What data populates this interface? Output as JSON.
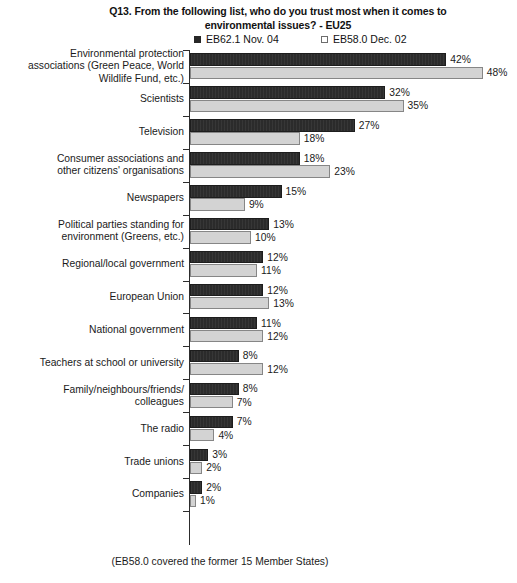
{
  "chart_data": {
    "type": "bar",
    "orientation": "horizontal",
    "title_lines": [
      "Q13. From the following list, who do you trust most when it comes to",
      "environmental issues? - EU25"
    ],
    "xlabel": "",
    "ylabel": "",
    "xlim": [
      0,
      48
    ],
    "grid": false,
    "legend_position": "top",
    "value_suffix": "%",
    "footnote": "(EB58.0 covered the former 15 Member States)",
    "categories": [
      "Environmental protection associations (Green Peace, World Wildlife Fund, etc.)",
      "Scientists",
      "Television",
      "Consumer associations and other citizens' organisations",
      "Newspapers",
      "Political parties standing for environment (Greens, etc.)",
      "Regional/local government",
      "European Union",
      "National government",
      "Teachers at school or university",
      "Family/neighbours/friends/colleagues",
      "The radio",
      "Trade unions",
      "Companies"
    ],
    "category_lines": [
      [
        "Environmental protection",
        "associations (Green Peace, World",
        "Wildlife Fund, etc.)"
      ],
      [
        "Scientists"
      ],
      [
        "Television"
      ],
      [
        "Consumer associations and",
        "other citizens' organisations"
      ],
      [
        "Newspapers"
      ],
      [
        "Political parties standing for",
        "environment (Greens, etc.)"
      ],
      [
        "Regional/local government"
      ],
      [
        "European Union"
      ],
      [
        "National government"
      ],
      [
        "Teachers at school or university"
      ],
      [
        "Family/neighbours/friends/",
        "colleagues"
      ],
      [
        "The radio"
      ],
      [
        "Trade unions"
      ],
      [
        "Companies"
      ]
    ],
    "series": [
      {
        "name": "EB62.1 Nov. 04",
        "color": "#2b2b2b",
        "values": [
          42,
          32,
          27,
          18,
          15,
          13,
          12,
          12,
          11,
          8,
          8,
          7,
          3,
          2
        ],
        "labels": [
          "42%",
          "32%",
          "27%",
          "18%",
          "15%",
          "13%",
          "12%",
          "12%",
          "11%",
          "8%",
          "8%",
          "7%",
          "3%",
          "2%"
        ]
      },
      {
        "name": "EB58.0 Dec. 02",
        "color": "#d3d3d3",
        "values": [
          48,
          35,
          18,
          23,
          9,
          10,
          11,
          13,
          12,
          12,
          7,
          4,
          2,
          1
        ],
        "labels": [
          "48%",
          "35%",
          "18%",
          "23%",
          "9%",
          "10%",
          "11%",
          "13%",
          "12%",
          "12%",
          "7%",
          "4%",
          "2%",
          "1%"
        ]
      }
    ]
  }
}
